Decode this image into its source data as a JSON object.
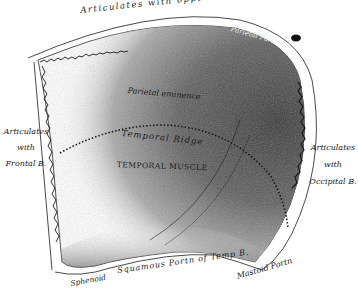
{
  "figure": {
    "colors": {
      "ink": "#1a1a1a",
      "dark_shade": "#3a3a3a",
      "mid_shade": "#7a7a7a",
      "paper": "#ffffff"
    }
  },
  "labels": {
    "top_border": "Articulates with opposite Parietal B.",
    "parietal_foramen": "Parietal Foramen",
    "parietal_eminence": "Parietal eminence",
    "temporal_ridge": "Temporal Ridge",
    "temporal_muscle": "TEMPORAL MUSCLE",
    "left_border": [
      "Articulates",
      "with",
      "Frontal B."
    ],
    "right_border": [
      "Articulates",
      "with",
      "Occipital B."
    ],
    "bottom_sphenoid": "Sphenoid",
    "bottom_squamous": "Squamous Portn of Temp B.",
    "bottom_mastoid": "Mastoid Portn"
  }
}
